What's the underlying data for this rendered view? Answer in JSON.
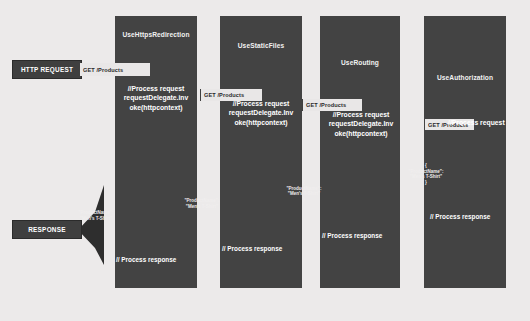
{
  "diagram": {
    "background_color": "#eceaea",
    "column_color": "#434343",
    "text_color": "#ffffff",
    "label_plate_color": "#e9e7e7"
  },
  "endpoints": [
    {
      "name": "http-request",
      "label": "HTTP REQUEST"
    },
    {
      "name": "response",
      "label": "RESPONSE"
    }
  ],
  "columns": [
    {
      "title": "UseHttpsRedirection"
    },
    {
      "title": "UseStaticFiles"
    },
    {
      "title": "UseRouting"
    },
    {
      "title": "UseAuthorization"
    }
  ],
  "request_labels": [
    {
      "text": "GET /Products"
    },
    {
      "text": "GET /Products"
    },
    {
      "text": "GET /Products"
    },
    {
      "text": "GET /Products"
    }
  ],
  "code_blocks": [
    {
      "text": "//Process request\nrequestDelegate.inv\noke(httpcontext)"
    },
    {
      "text": "//Process request\nrequestDelegate.Inv\noke(httpcontext)"
    },
    {
      "text": "//Process request\nrequestDelegate.Inv\noke(httpcontext)"
    },
    {
      "text": "//Process request"
    }
  ],
  "response_labels": [
    {
      "text": "// Process response"
    },
    {
      "text": "// Process response"
    },
    {
      "text": "// Process response"
    },
    {
      "text": "// Process response"
    }
  ],
  "payloads": [
    {
      "text": "\"ProductName\":\n\"Men's T-Shirt\""
    },
    {
      "text": "\"ProductName\":\n\"Men's T-Shirt\""
    },
    {
      "text": "{\n\"ProductName\":\n\"Men's T-Shirt\"\n}"
    },
    {
      "text": "{\n\"ProductName\":\n\"Men's T-Shirt\"\n}"
    }
  ]
}
